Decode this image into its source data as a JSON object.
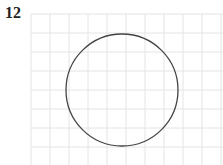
{
  "problem": {
    "number": "12"
  },
  "figure": {
    "grid": {
      "x0": 31,
      "y0": 14,
      "x1": 223,
      "y1": 165,
      "spacing": 19,
      "color": "#e4e4e4"
    },
    "circle": {
      "cx": 122,
      "cy": 90,
      "r": 56,
      "stroke": "#444444"
    }
  }
}
